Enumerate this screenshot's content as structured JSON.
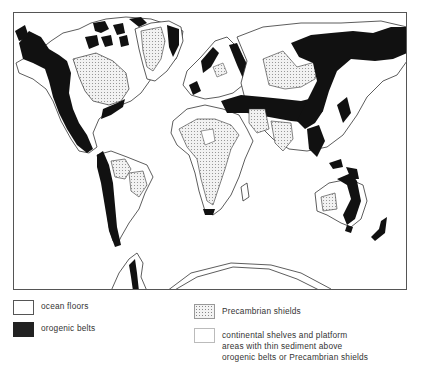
{
  "map": {
    "title": "",
    "projection": "world map, Pacific-left layout",
    "colors": {
      "ocean": "#ffffff",
      "orogenic": "#111111",
      "precambrian_fill": "#f0f0f0",
      "precambrian_dots": "#888888",
      "outline": "#333333"
    }
  },
  "legend": {
    "items": [
      {
        "key": "ocean",
        "label": "ocean floors"
      },
      {
        "key": "orogenic",
        "label": "orogenic belts"
      },
      {
        "key": "precambrian",
        "label": "Precambrian shields"
      },
      {
        "key": "shelves",
        "label_lines": [
          "continental shelves and platform",
          "areas with thin sediment above",
          "orogenic belts or Precambrian shields"
        ]
      }
    ]
  }
}
